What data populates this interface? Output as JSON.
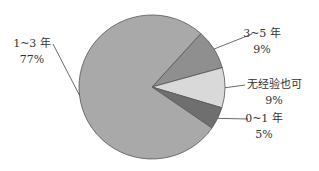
{
  "chart_data": {
    "type": "pie",
    "title": "",
    "start_angle_deg": -48,
    "direction": "clockwise",
    "slices": [
      {
        "label": "3~5 年",
        "value": 9,
        "value_label": "9%",
        "color": "#8f8f8f"
      },
      {
        "label": "无经验也可",
        "value": 9,
        "value_label": "9%",
        "color": "#d9d9d9"
      },
      {
        "label": "0~1 年",
        "value": 5,
        "value_label": "5%",
        "color": "#6f6f6f"
      },
      {
        "label": "1~3 年",
        "value": 77,
        "value_label": "77%",
        "color": "#a9a9a9"
      }
    ],
    "legend": "none",
    "labels": "outside-with-leader-lines"
  }
}
